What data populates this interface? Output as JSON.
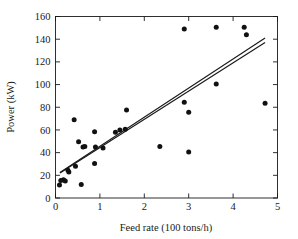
{
  "chart_data": {
    "type": "scatter",
    "title": "",
    "xlabel": "Feed rate (100 tons/h)",
    "ylabel": "Power (kW)",
    "xlim": [
      0,
      5
    ],
    "ylim": [
      0,
      160
    ],
    "xticks": [
      0,
      1,
      2,
      3,
      4,
      5
    ],
    "yticks": [
      0,
      20,
      40,
      60,
      80,
      100,
      120,
      140,
      160
    ],
    "xtick_labels": [
      "0",
      "1",
      "2",
      "3",
      "4",
      "5"
    ],
    "ytick_labels": [
      "0",
      "20",
      "40",
      "60",
      "80",
      "100",
      "120",
      "140",
      "160"
    ],
    "grid": false,
    "legend": null,
    "frame": "box",
    "tick_direction": "in",
    "marker": "filled-circle",
    "marker_color": "#111111",
    "line_color": "#1a1a1a",
    "background": "#ffffff",
    "points": [
      {
        "x": 0.09,
        "y": 11.5
      },
      {
        "x": 0.12,
        "y": 15.5
      },
      {
        "x": 0.18,
        "y": 16.0
      },
      {
        "x": 0.22,
        "y": 15.0
      },
      {
        "x": 0.28,
        "y": 24.5
      },
      {
        "x": 0.3,
        "y": 23.0
      },
      {
        "x": 0.42,
        "y": 69.0
      },
      {
        "x": 0.45,
        "y": 28.0
      },
      {
        "x": 0.52,
        "y": 49.5
      },
      {
        "x": 0.58,
        "y": 12.0
      },
      {
        "x": 0.62,
        "y": 45.0
      },
      {
        "x": 0.66,
        "y": 45.5
      },
      {
        "x": 0.88,
        "y": 58.5
      },
      {
        "x": 0.88,
        "y": 30.5
      },
      {
        "x": 0.9,
        "y": 45.0
      },
      {
        "x": 1.07,
        "y": 44.0
      },
      {
        "x": 1.35,
        "y": 58.0
      },
      {
        "x": 1.45,
        "y": 60.0
      },
      {
        "x": 1.57,
        "y": 60.5
      },
      {
        "x": 1.6,
        "y": 77.5
      },
      {
        "x": 2.35,
        "y": 45.5
      },
      {
        "x": 2.9,
        "y": 149.0
      },
      {
        "x": 2.9,
        "y": 84.5
      },
      {
        "x": 3.0,
        "y": 75.5
      },
      {
        "x": 3.0,
        "y": 40.5
      },
      {
        "x": 3.62,
        "y": 150.5
      },
      {
        "x": 3.62,
        "y": 100.5
      },
      {
        "x": 4.25,
        "y": 150.5
      },
      {
        "x": 4.3,
        "y": 144.0
      },
      {
        "x": 4.72,
        "y": 83.5
      }
    ],
    "fit_lines": [
      {
        "name": "fit-line-1",
        "x": [
          0.1,
          4.72
        ],
        "y": [
          22.0,
          137.0
        ]
      },
      {
        "name": "fit-line-2",
        "x": [
          0.1,
          4.72
        ],
        "y": [
          22.5,
          141.0
        ]
      }
    ]
  }
}
